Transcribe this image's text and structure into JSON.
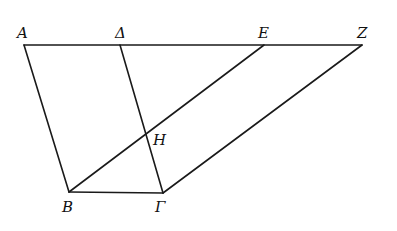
{
  "diagram": {
    "points": {
      "A": {
        "label": "A",
        "x": 24,
        "y": 45
      },
      "D": {
        "label": "Δ",
        "x": 120,
        "y": 45
      },
      "E": {
        "label": "E",
        "x": 264,
        "y": 45
      },
      "Z": {
        "label": "Z",
        "x": 362,
        "y": 45
      },
      "B": {
        "label": "B",
        "x": 69,
        "y": 192
      },
      "G": {
        "label": "Γ",
        "x": 163,
        "y": 193
      },
      "H": {
        "label": "H",
        "x": 147,
        "y": 134
      }
    },
    "segments": [
      [
        "A",
        "Z"
      ],
      [
        "A",
        "B"
      ],
      [
        "D",
        "G"
      ],
      [
        "B",
        "G"
      ],
      [
        "B",
        "E"
      ],
      [
        "G",
        "Z"
      ]
    ]
  }
}
